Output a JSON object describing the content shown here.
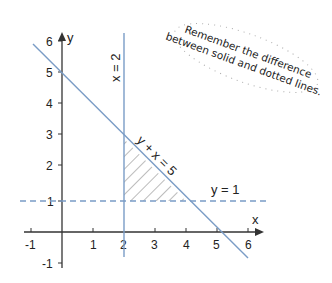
{
  "diagram": {
    "type": "coordinate-graph",
    "axes": {
      "x_label": "x",
      "y_label": "y",
      "x_ticks": [
        "-1",
        "1",
        "2",
        "3",
        "4",
        "5",
        "6"
      ],
      "y_ticks": [
        "6",
        "5",
        "4",
        "3",
        "2",
        "1",
        "-1"
      ]
    },
    "lines": [
      {
        "label": "x = 2",
        "style": "solid",
        "color": "#7a9cc6"
      },
      {
        "label": "y + x = 5",
        "style": "solid",
        "color": "#7a9cc6"
      },
      {
        "label": "y = 1",
        "style": "dashed",
        "color": "#7a9cc6"
      }
    ],
    "shaded_region": "bounded by x = 2, y + x = 5, y = 1",
    "note": {
      "line1": "Remember the difference",
      "line2": "between solid and dotted lines."
    }
  }
}
